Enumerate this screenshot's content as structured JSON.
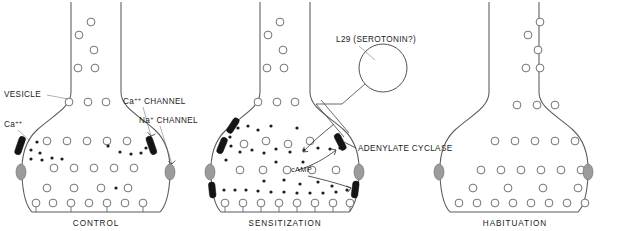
{
  "diagram": {
    "background": "#ffffff",
    "colors": {
      "membrane": "#5a5a5a",
      "vesicle_stroke": "#6b6b6b",
      "calcium_dot": "#1d1d1d",
      "channel": "#141414",
      "receptor_oval": "#9b9b9b",
      "text": "#1a1a1a"
    }
  },
  "panels": [
    {
      "id": "control",
      "caption": "CONTROL",
      "caption_x": 96,
      "labels": [
        {
          "name": "vesicle-label",
          "text": "VESICLE",
          "x": 4,
          "y": 97
        },
        {
          "name": "calcium-label",
          "text": "Ca",
          "sup": "++",
          "x": 4,
          "y": 127
        },
        {
          "name": "calcium-channel-label",
          "text": "Ca",
          "sup": "++",
          "rest": " CHANNEL",
          "x": 123,
          "y": 104
        },
        {
          "name": "sodium-channel-label",
          "text": "Na",
          "sup": "+",
          "rest": " CHANNEL",
          "x": 139,
          "y": 123
        }
      ]
    },
    {
      "id": "sensitization",
      "caption": "SENSITIZATION",
      "caption_x": 285,
      "labels": [
        {
          "name": "l29-label",
          "text": "L29   (SEROTONIN?)",
          "x": 336,
          "y": 42
        },
        {
          "name": "adenylate-cyclase-label",
          "text": "ADENYLATE CYCLASE",
          "x": 358,
          "y": 151
        },
        {
          "name": "camp-label",
          "text": "cAMP",
          "x": 291,
          "y": 172
        }
      ]
    },
    {
      "id": "habituation",
      "caption": "HABITUATION",
      "caption_x": 515,
      "labels": []
    }
  ],
  "legend_terms": [
    "VESICLE",
    "Ca++",
    "Ca++ CHANNEL",
    "Na+ CHANNEL",
    "L29 (SEROTONIN?)",
    "ADENYLATE CYCLASE",
    "cAMP"
  ]
}
